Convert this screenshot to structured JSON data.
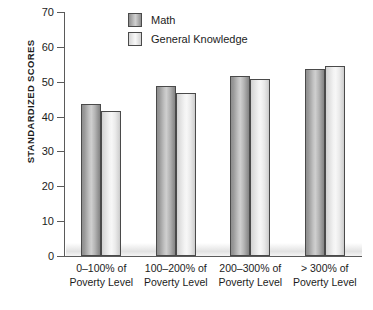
{
  "chart_data": {
    "type": "bar",
    "title": "",
    "xlabel": "",
    "ylabel": "STANDARDIZED SCORES",
    "ylim": [
      0,
      70
    ],
    "yticks": [
      0,
      10,
      20,
      30,
      40,
      50,
      60,
      70
    ],
    "grid": false,
    "legend_position": "top-center",
    "categories": [
      "0–100% of Poverty Level",
      "100–200% of Poverty Level",
      "200–300% of Poverty Level",
      "> 300% of Poverty Level"
    ],
    "category_lines": [
      [
        "0–100% of",
        "Poverty Level"
      ],
      [
        "100–200% of",
        "Poverty Level"
      ],
      [
        "200–300% of",
        "Poverty Level"
      ],
      [
        "> 300% of",
        "Poverty Level"
      ]
    ],
    "series": [
      {
        "name": "Math",
        "color": "#a8a8a8",
        "values": [
          43.7,
          48.7,
          51.7,
          53.7
        ]
      },
      {
        "name": "General Knowledge",
        "color": "#efefef",
        "values": [
          41.6,
          46.7,
          50.7,
          54.6
        ]
      }
    ]
  },
  "axis": {
    "y_title": "STANDARDIZED SCORES",
    "tick_labels": [
      "70",
      "60",
      "50",
      "40",
      "30",
      "20",
      "10",
      "0"
    ]
  },
  "legend": {
    "items": [
      {
        "label": "Math",
        "swatch": "math-swatch"
      },
      {
        "label": "General Knowledge",
        "swatch": "general-knowledge-swatch"
      }
    ]
  }
}
